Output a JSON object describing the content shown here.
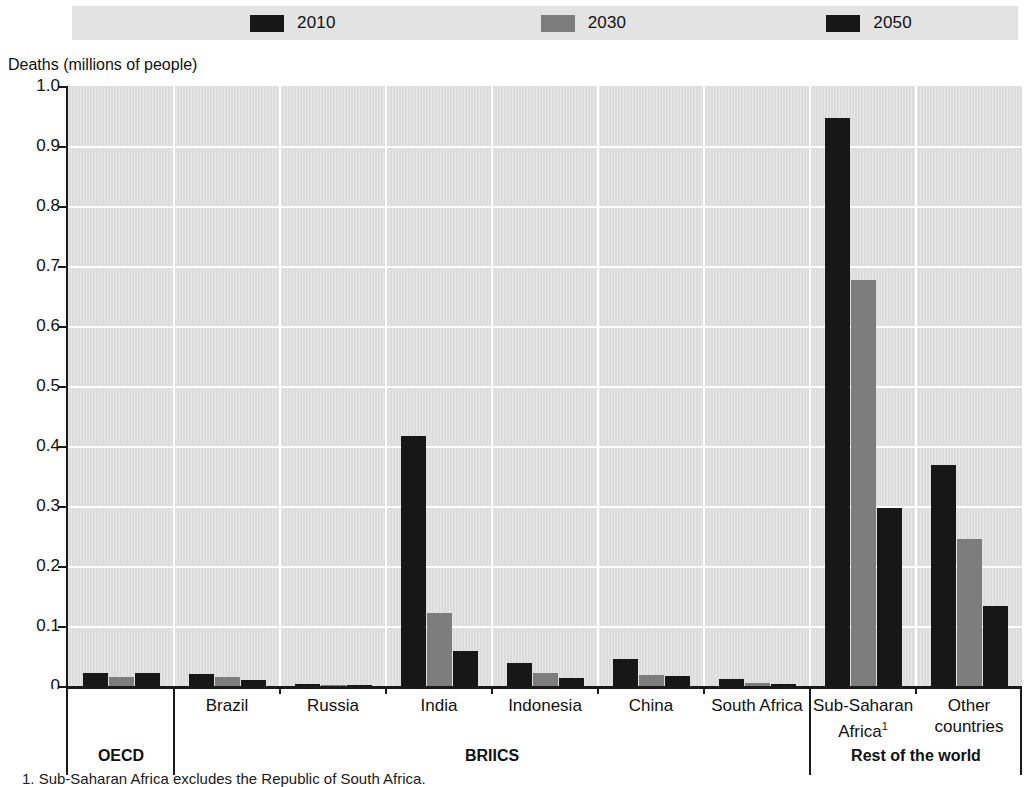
{
  "legend": {
    "items": [
      {
        "label": "2010",
        "color": "#171717",
        "name": "legend-2010"
      },
      {
        "label": "2030",
        "color": "#7d7d7d",
        "name": "legend-2030"
      },
      {
        "label": "2050",
        "color": "#171717",
        "name": "legend-2050"
      }
    ]
  },
  "axis": {
    "y_title": "Deaths (millions of people)",
    "y_ticks": [
      "1.0",
      "0.9",
      "0.8",
      "0.7",
      "0.6",
      "0.5",
      "0.4",
      "0.3",
      "0.2",
      "0.1",
      "0"
    ]
  },
  "groups": [
    {
      "label": "OECD",
      "name": "group-oecd"
    },
    {
      "label": "BRIICS",
      "name": "group-briics"
    },
    {
      "label": "Rest of the world",
      "name": "group-rest-of-the-world"
    }
  ],
  "footnote": "1. Sub-Saharan Africa excludes the Republic of South Africa.",
  "chart_data": {
    "type": "bar",
    "title": "",
    "xlabel": "",
    "ylabel": "Deaths (millions of people)",
    "ylim": [
      0,
      1.0
    ],
    "ytick_values": [
      1.0,
      0.9,
      0.8,
      0.7,
      0.6,
      0.5,
      0.4,
      0.3,
      0.2,
      0.1,
      0
    ],
    "grid": true,
    "legend_position": "top",
    "categories": [
      "",
      "Brazil",
      "Russia",
      "India",
      "Indonesia",
      "China",
      "South Africa",
      "Sub-Saharan Africa¹",
      "Other countries"
    ],
    "category_labels_plain": [
      "",
      "Brazil",
      "Russia",
      "India",
      "Indonesia",
      "China",
      "South Africa",
      "Sub-Saharan Africa",
      "Other countries"
    ],
    "group_spans": [
      {
        "label": "OECD",
        "categories": [
          ""
        ]
      },
      {
        "label": "BRIICS",
        "categories": [
          "Brazil",
          "Russia",
          "India",
          "Indonesia",
          "China",
          "South Africa"
        ]
      },
      {
        "label": "Rest of the world",
        "categories": [
          "Sub-Saharan Africa¹",
          "Other countries"
        ]
      }
    ],
    "series": [
      {
        "name": "2010",
        "color": "#171717",
        "values": [
          0.022,
          0.02,
          0.004,
          0.417,
          0.038,
          0.045,
          0.012,
          0.946,
          0.368
        ]
      },
      {
        "name": "2030",
        "color": "#7d7d7d",
        "values": [
          0.015,
          0.015,
          0.002,
          0.122,
          0.022,
          0.018,
          0.005,
          0.677,
          0.245
        ]
      },
      {
        "name": "2050",
        "color": "#171717",
        "values": [
          0.021,
          0.01,
          0.002,
          0.059,
          0.013,
          0.017,
          0.003,
          0.296,
          0.134
        ]
      }
    ]
  }
}
